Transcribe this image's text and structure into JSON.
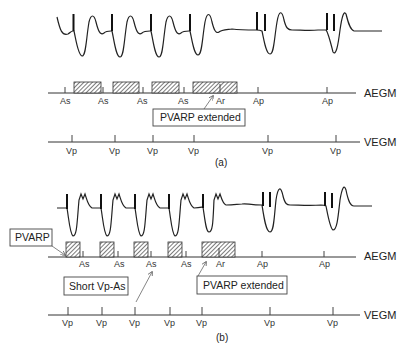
{
  "figure": {
    "panels": [
      {
        "caption": "(a)",
        "aegm": {
          "channel_label": "AEGM",
          "events": [
            {
              "label": "As",
              "x": 65
            },
            {
              "label": "As",
              "x": 103
            },
            {
              "label": "As",
              "x": 142
            },
            {
              "label": "As",
              "x": 183
            },
            {
              "label": "Ar",
              "x": 219
            },
            {
              "label": "Ap",
              "x": 258
            },
            {
              "label": "Ap",
              "x": 327
            }
          ]
        },
        "vegm": {
          "channel_label": "VEGM",
          "events": [
            {
              "label": "Vp",
              "x": 72
            },
            {
              "label": "Vp",
              "x": 115
            },
            {
              "label": "Vp",
              "x": 153
            },
            {
              "label": "Vp",
              "x": 194
            },
            {
              "label": "Vp",
              "x": 268
            },
            {
              "label": "Vp",
              "x": 336
            }
          ]
        },
        "annotations": [
          {
            "text": "PVARP extended"
          }
        ]
      },
      {
        "caption": "(b)",
        "aegm": {
          "channel_label": "AEGM",
          "events": [
            {
              "label": "As",
              "x": 83
            },
            {
              "label": "As",
              "x": 118
            },
            {
              "label": "As",
              "x": 151
            },
            {
              "label": "As",
              "x": 186
            },
            {
              "label": "Ar",
              "x": 219
            },
            {
              "label": "Ap",
              "x": 262
            },
            {
              "label": "Ap",
              "x": 324
            }
          ]
        },
        "vegm": {
          "channel_label": "VEGM",
          "events": [
            {
              "label": "Vp",
              "x": 68
            },
            {
              "label": "Vp",
              "x": 102
            },
            {
              "label": "Vp",
              "x": 135
            },
            {
              "label": "Vp",
              "x": 170
            },
            {
              "label": "Vp",
              "x": 202
            },
            {
              "label": "Vp",
              "x": 270
            },
            {
              "label": "Vp",
              "x": 333
            }
          ]
        },
        "annotations": [
          {
            "text": "PVARP"
          },
          {
            "text": "Short Vp-As"
          },
          {
            "text": "PVARP extended"
          }
        ]
      }
    ]
  }
}
